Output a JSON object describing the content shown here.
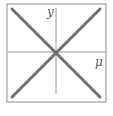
{
  "diagram": {
    "labels": {
      "vertical_axis": "y",
      "horizontal_axis": "μ"
    },
    "colors": {
      "frame": "#8a8a8a",
      "axes": "#9a9a9a",
      "diagonals": "#6e6e6e",
      "label": "#555555"
    }
  }
}
